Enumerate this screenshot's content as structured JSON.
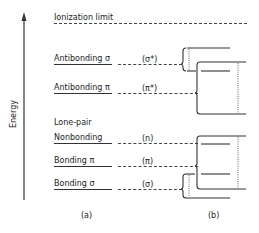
{
  "axis": {
    "label": "Energy"
  },
  "left_panel": {
    "caption": "(a)",
    "ionization_label": "Ionization limit",
    "levels": [
      {
        "name": "Antibonding σ",
        "symbol": "(σ*)"
      },
      {
        "name": "Antibonding π",
        "symbol": "(π*)"
      },
      {
        "name": "Nonbonding",
        "symbol": "(n)",
        "group_label": "Lone-pair"
      },
      {
        "name": "Bonding π",
        "symbol": "(π)"
      },
      {
        "name": "Bonding σ",
        "symbol": "(σ)"
      }
    ]
  },
  "right_panel": {
    "caption": "(b)"
  }
}
